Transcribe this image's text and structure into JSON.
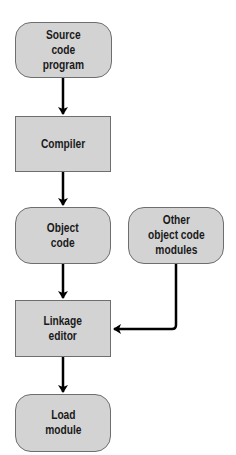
{
  "diagram": {
    "type": "flowchart",
    "nodes": [
      {
        "id": "source",
        "label": "Source\ncode\nprogram",
        "shape": "rounded"
      },
      {
        "id": "compiler",
        "label": "Compiler",
        "shape": "rectangle"
      },
      {
        "id": "object",
        "label": "Object\ncode",
        "shape": "rounded"
      },
      {
        "id": "other",
        "label": "Other\nobject code\nmodules",
        "shape": "rounded"
      },
      {
        "id": "linkage",
        "label": "Linkage\neditor",
        "shape": "rectangle"
      },
      {
        "id": "load",
        "label": "Load\nmodule",
        "shape": "rounded"
      }
    ],
    "edges": [
      {
        "from": "source",
        "to": "compiler"
      },
      {
        "from": "compiler",
        "to": "object"
      },
      {
        "from": "object",
        "to": "linkage"
      },
      {
        "from": "other",
        "to": "linkage"
      },
      {
        "from": "linkage",
        "to": "load"
      }
    ],
    "colors": {
      "node_fill": "#d3d3d3",
      "node_border": "#6e6e6e",
      "arrow": "#000000"
    }
  }
}
